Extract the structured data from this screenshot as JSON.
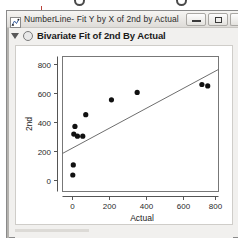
{
  "window": {
    "title": "NumberLine- Fit Y by X of 2nd by Actual",
    "icon_name": "jmp-report-icon",
    "controls": {
      "minimize_label": "Minimize",
      "maximize_label": "Maximize",
      "close_label": "Close"
    }
  },
  "report": {
    "disclosure_state": "expanded",
    "node_icon_name": "report-node-icon",
    "title": "Bivariate Fit of 2nd By Actual"
  },
  "chart_data": {
    "type": "scatter",
    "title": "Bivariate Fit of 2nd By Actual",
    "xlabel": "Actual",
    "ylabel": "2nd",
    "xlim": [
      -60,
      880
    ],
    "ylim": [
      -60,
      880
    ],
    "xticks": [
      0,
      200,
      400,
      600,
      800
    ],
    "yticks": [
      0,
      200,
      400,
      600,
      800
    ],
    "xtick_labels": [
      "0",
      "200",
      "400",
      "600",
      "800"
    ],
    "ytick_labels": [
      "0",
      "200",
      "400",
      "600",
      "800"
    ],
    "grid": false,
    "legend": "none",
    "points": [
      {
        "x": 2,
        "y": 55
      },
      {
        "x": 5,
        "y": 125
      },
      {
        "x": 8,
        "y": 340
      },
      {
        "x": 15,
        "y": 393
      },
      {
        "x": 30,
        "y": 325
      },
      {
        "x": 62,
        "y": 325
      },
      {
        "x": 80,
        "y": 475
      },
      {
        "x": 235,
        "y": 578
      },
      {
        "x": 390,
        "y": 630
      },
      {
        "x": 780,
        "y": 685
      },
      {
        "x": 815,
        "y": 675
      }
    ],
    "fit_line": {
      "name": "Linear Fit",
      "x_start": -60,
      "y_start": 205,
      "x_end": 880,
      "y_end": 790
    }
  }
}
